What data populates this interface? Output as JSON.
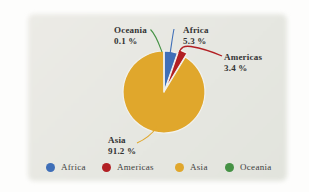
{
  "chart_data": {
    "type": "pie",
    "title": "",
    "categories": [
      "Africa",
      "Americas",
      "Asia",
      "Oceania"
    ],
    "values": [
      5.3,
      3.4,
      91.2,
      0.1
    ],
    "unit": "%",
    "colors": {
      "Africa": "#3f6fb8",
      "Americas": "#b22024",
      "Asia": "#e0a72c",
      "Oceania": "#459245"
    },
    "exploded_slice": "Americas",
    "legend_position": "bottom",
    "background_color": "#e6e7e1",
    "callouts": [
      {
        "name": "Oceania",
        "value": "0.1 %"
      },
      {
        "name": "Africa",
        "value": "5.3 %"
      },
      {
        "name": "Americas",
        "value": "3.4 %"
      },
      {
        "name": "Asia",
        "value": "91.2 %"
      }
    ],
    "legend": [
      {
        "label": "Africa",
        "color": "#3f6fb8"
      },
      {
        "label": "Americas",
        "color": "#b22024"
      },
      {
        "label": "Asia",
        "color": "#e0a72c"
      },
      {
        "label": "Oceania",
        "color": "#459245"
      }
    ]
  }
}
